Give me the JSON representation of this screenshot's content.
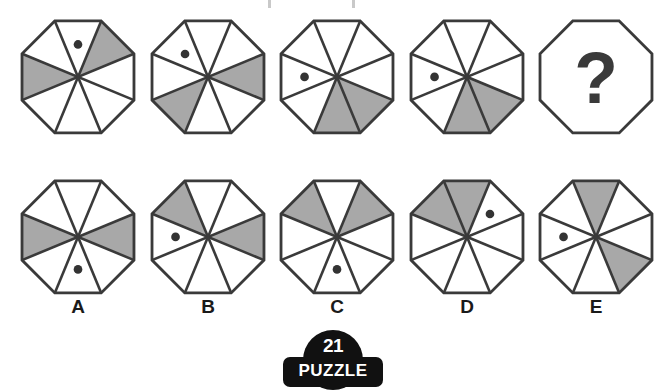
{
  "puzzle": {
    "number": "21",
    "word": "PUZZLE",
    "question_mark": "?",
    "geometry": {
      "shape": "octagon",
      "sectors": 8,
      "stroke_color": "#3a3a3a",
      "fill_empty": "#ffffff",
      "fill_shaded": "#a8a8a8",
      "dot_color": "#333333"
    },
    "sector_index_note": "sectors numbered 0-7 clockwise starting at the sector just right of top vertical (1 o'clock)",
    "sequence": [
      {
        "name": "sequence-figure-1",
        "shaded_sectors": [
          0,
          5
        ],
        "dot_sector": 7
      },
      {
        "name": "sequence-figure-2",
        "shaded_sectors": [
          1,
          4
        ],
        "dot_sector": 6
      },
      {
        "name": "sequence-figure-3",
        "shaded_sectors": [
          2,
          3
        ],
        "dot_sector": 5
      },
      {
        "name": "sequence-figure-4",
        "shaded_sectors": [
          2,
          3
        ],
        "dot_sector": 5
      },
      {
        "name": "sequence-figure-5-unknown",
        "shaded_sectors": [],
        "dot_sector": null,
        "is_unknown": true
      }
    ],
    "options": [
      {
        "label": "A",
        "name": "option-a",
        "shaded_sectors": [
          1,
          5
        ],
        "dot_sector": 3
      },
      {
        "label": "B",
        "name": "option-b",
        "shaded_sectors": [
          1,
          6
        ],
        "dot_sector": 5
      },
      {
        "label": "C",
        "name": "option-c",
        "shaded_sectors": [
          0,
          6
        ],
        "dot_sector": 3
      },
      {
        "label": "D",
        "name": "option-d",
        "shaded_sectors": [
          6,
          7
        ],
        "dot_sector": 0
      },
      {
        "label": "E",
        "name": "option-e",
        "shaded_sectors": [
          2,
          7
        ],
        "dot_sector": 5
      }
    ]
  }
}
